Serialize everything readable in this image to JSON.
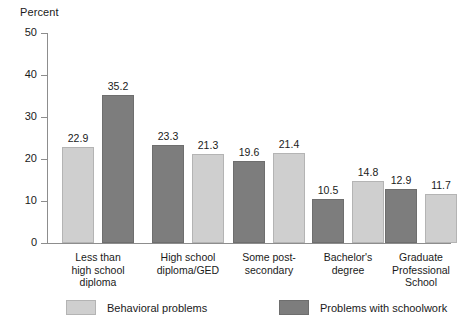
{
  "chart_data": {
    "type": "bar",
    "title": "",
    "ylabel": "Percent",
    "xlabel": "",
    "ylim": [
      0,
      50
    ],
    "yticks": [
      0,
      10,
      20,
      30,
      40,
      50
    ],
    "grid": false,
    "legend_position": "bottom",
    "categories": [
      "Less than\nhigh school\ndiploma",
      "High school\ndiploma/GED",
      "Some post-\nsecondary",
      "Bachelor's\ndegree",
      "Graduate\nProfessional\nSchool"
    ],
    "series": [
      {
        "name": "Behavioral problems",
        "color": "#cfcfcf",
        "values": [
          22.9,
          21.3,
          21.4,
          14.8,
          11.7
        ]
      },
      {
        "name": "Problems with schoolwork",
        "color": "#7d7d7d",
        "values": [
          35.2,
          23.3,
          19.6,
          10.5,
          12.9
        ]
      }
    ],
    "bar_order_per_group": [
      [
        "Behavioral problems",
        "Problems with schoolwork"
      ],
      [
        "Problems with schoolwork",
        "Behavioral problems"
      ],
      [
        "Problems with schoolwork",
        "Behavioral problems"
      ],
      [
        "Problems with schoolwork",
        "Behavioral problems"
      ],
      [
        "Problems with schoolwork",
        "Behavioral problems"
      ]
    ],
    "value_labels": [
      "22.9",
      "35.2",
      "23.3",
      "21.3",
      "19.6",
      "21.4",
      "10.5",
      "14.8",
      "12.9",
      "11.7"
    ]
  },
  "axis": {
    "y_title": "Percent",
    "tick_labels": [
      "50",
      "40",
      "30",
      "20",
      "10",
      "0"
    ]
  },
  "legend": {
    "items": [
      {
        "label": "Behavioral problems",
        "tone": "light"
      },
      {
        "label": "Problems with schoolwork",
        "tone": "dark"
      }
    ]
  }
}
